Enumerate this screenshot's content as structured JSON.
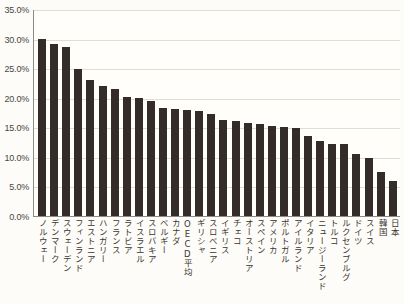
{
  "chart_data": {
    "type": "bar",
    "title": "",
    "xlabel": "",
    "ylabel": "",
    "ylim": [
      0,
      35
    ],
    "ytick_labels": [
      "35.0%",
      "30.0%",
      "25.0%",
      "20.0%",
      "15.0%",
      "10.0%",
      "5.0%",
      "0.0%"
    ],
    "ytick_values": [
      35,
      30,
      25,
      20,
      15,
      10,
      5,
      0
    ],
    "grid": true,
    "legend": false,
    "bar_color": "#342c28",
    "background_color": "#fdfcf8",
    "gridline_color": "#e0ddd5",
    "axis_color": "#8d8a84",
    "categories": [
      "ノルウェー",
      "デンマーク",
      "スウェーデン",
      "フィンランド",
      "エストニア",
      "ハンガリー",
      "フランス",
      "ラトビア",
      "イスラエル",
      "スロバキア",
      "ベルギー",
      "カナダ",
      "OECD平均",
      "ギリシャ",
      "スロベニア",
      "イギリス",
      "チェコ",
      "オーストリア",
      "スペイン",
      "アメリカ",
      "ポルトガル",
      "アイルランド",
      "イタリア",
      "ニュージーランド",
      "トルコ",
      "ルクセンブルグ",
      "ドイツ",
      "スイス",
      "韓国",
      "日本"
    ],
    "values": [
      30.0,
      29.1,
      28.6,
      24.9,
      23.0,
      21.9,
      21.4,
      20.1,
      19.9,
      19.4,
      18.3,
      18.1,
      18.0,
      17.8,
      17.3,
      16.3,
      16.1,
      15.8,
      15.5,
      15.2,
      15.0,
      14.8,
      13.5,
      12.6,
      12.2,
      12.2,
      10.5,
      9.8,
      7.5,
      5.9
    ],
    "value_labels": [
      "30.0%",
      "29.1%",
      "28.6%",
      "24.9%",
      "23.0%",
      "21.9%",
      "21.4%",
      "20.1%",
      "19.9%",
      "19.4%",
      "18.3%",
      "18.1%",
      "18.0%",
      "17.8%",
      "17.3%",
      "16.3%",
      "16.1%",
      "15.8%",
      "15.5%",
      "15.2%",
      "15.0%",
      "14.8%",
      "13.5%",
      "12.6%",
      "12.2%",
      "12.2%",
      "10.5%",
      "9.8%",
      "7.5%",
      "5.9%"
    ]
  }
}
